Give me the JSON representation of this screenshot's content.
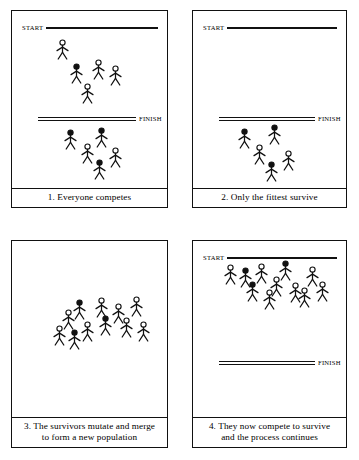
{
  "diagram": {
    "line_colour": "#111111",
    "background": "#ffffff"
  },
  "labels": {
    "start": "START",
    "finish": "FINISH"
  },
  "panels": [
    {
      "id": "panel-1",
      "number": "1",
      "caption_lines": [
        "1. Everyone competes"
      ],
      "lines": [
        {
          "name": "start-line",
          "type": "single",
          "label": "START",
          "label_side": "left",
          "x": 10,
          "y": 12,
          "rule_width": 112
        },
        {
          "name": "finish-line",
          "type": "double",
          "label": "FINISH",
          "label_side": "right",
          "x": 26,
          "y": 103,
          "rule_width": 98
        }
      ],
      "figures": [
        {
          "x": 43,
          "y": 28,
          "head": "open"
        },
        {
          "x": 57,
          "y": 52,
          "head": "filled"
        },
        {
          "x": 79,
          "y": 48,
          "head": "open"
        },
        {
          "x": 96,
          "y": 54,
          "head": "open"
        },
        {
          "x": 68,
          "y": 72,
          "head": "open"
        },
        {
          "x": 51,
          "y": 118,
          "head": "filled"
        },
        {
          "x": 82,
          "y": 116,
          "head": "filled"
        },
        {
          "x": 68,
          "y": 132,
          "head": "open"
        },
        {
          "x": 96,
          "y": 136,
          "head": "open"
        },
        {
          "x": 80,
          "y": 148,
          "head": "filled"
        }
      ]
    },
    {
      "id": "panel-2",
      "number": "2",
      "caption_lines": [
        "2. Only the fittest survive"
      ],
      "lines": [
        {
          "name": "start-line",
          "type": "single",
          "label": "START",
          "label_side": "left",
          "x": 10,
          "y": 12,
          "rule_width": 110
        },
        {
          "name": "finish-line",
          "type": "double",
          "label": "FINISH",
          "label_side": "right",
          "x": 26,
          "y": 103,
          "rule_width": 96
        }
      ],
      "figures": [
        {
          "x": 44,
          "y": 117,
          "head": "filled"
        },
        {
          "x": 74,
          "y": 113,
          "head": "filled"
        },
        {
          "x": 59,
          "y": 133,
          "head": "open"
        },
        {
          "x": 88,
          "y": 139,
          "head": "open"
        },
        {
          "x": 71,
          "y": 150,
          "head": "filled"
        }
      ]
    },
    {
      "id": "panel-3",
      "number": "3",
      "caption_lines": [
        "3. The survivors mutate and merge",
        "to form a new population"
      ],
      "lines": [],
      "figures": [
        {
          "x": 49,
          "y": 68,
          "head": "open"
        },
        {
          "x": 60,
          "y": 58,
          "head": "filled"
        },
        {
          "x": 82,
          "y": 56,
          "head": "open"
        },
        {
          "x": 99,
          "y": 62,
          "head": "open"
        },
        {
          "x": 117,
          "y": 55,
          "head": "open"
        },
        {
          "x": 68,
          "y": 80,
          "head": "open"
        },
        {
          "x": 86,
          "y": 74,
          "head": "filled"
        },
        {
          "x": 107,
          "y": 76,
          "head": "open"
        },
        {
          "x": 124,
          "y": 80,
          "head": "open"
        },
        {
          "x": 55,
          "y": 88,
          "head": "filled"
        },
        {
          "x": 40,
          "y": 84,
          "head": "open"
        }
      ]
    },
    {
      "id": "panel-4",
      "number": "4",
      "caption_lines": [
        "4. They now compete to survive",
        "and the process continues"
      ],
      "lines": [
        {
          "name": "start-line",
          "type": "single",
          "label": "START",
          "label_side": "left",
          "x": 10,
          "y": 12,
          "rule_width": 110
        },
        {
          "name": "finish-line",
          "type": "double",
          "label": "FINISH",
          "label_side": "right",
          "x": 26,
          "y": 117,
          "rule_width": 96
        }
      ],
      "figures": [
        {
          "x": 30,
          "y": 23,
          "head": "open"
        },
        {
          "x": 45,
          "y": 26,
          "head": "filled"
        },
        {
          "x": 61,
          "y": 22,
          "head": "open"
        },
        {
          "x": 85,
          "y": 19,
          "head": "filled"
        },
        {
          "x": 112,
          "y": 25,
          "head": "open"
        },
        {
          "x": 52,
          "y": 40,
          "head": "filled"
        },
        {
          "x": 76,
          "y": 35,
          "head": "open"
        },
        {
          "x": 69,
          "y": 48,
          "head": "open"
        },
        {
          "x": 95,
          "y": 41,
          "head": "open"
        },
        {
          "x": 104,
          "y": 46,
          "head": "open"
        },
        {
          "x": 122,
          "y": 40,
          "head": "open"
        }
      ]
    }
  ]
}
